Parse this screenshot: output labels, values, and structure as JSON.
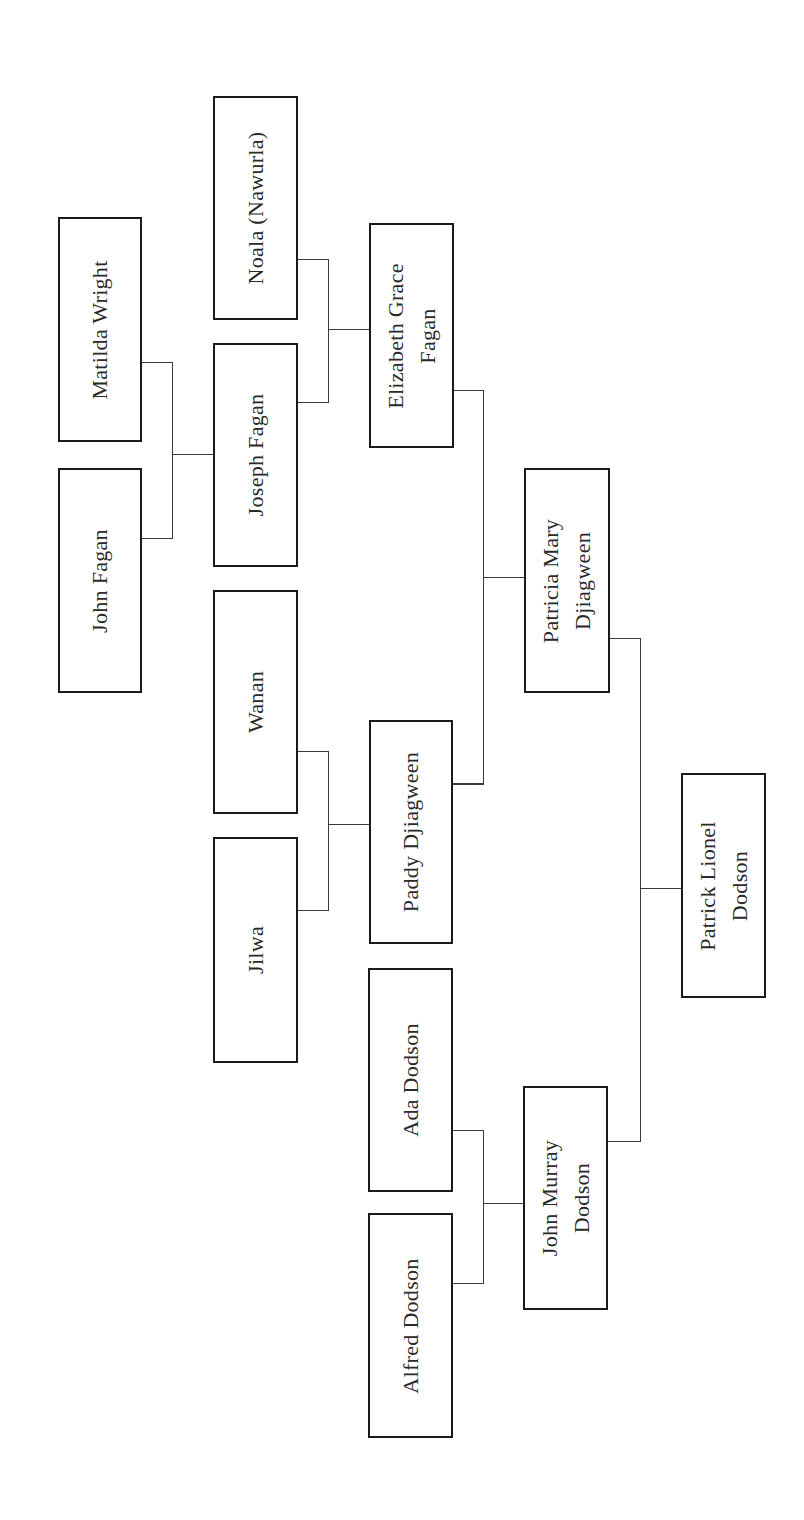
{
  "diagram": {
    "type": "family-tree",
    "orientation": "rotated-90-ccw",
    "colors": {
      "box_border": "#1a1a1a",
      "line": "#3a3a3a",
      "text": "#2a2a2a",
      "background": "#ffffff"
    },
    "people": [
      {
        "id": "matilda_wright",
        "lines": [
          "Matilda Wright"
        ],
        "generation": 4
      },
      {
        "id": "john_fagan",
        "lines": [
          "John Fagan"
        ],
        "generation": 4
      },
      {
        "id": "noala",
        "lines": [
          "Noala (Nawurla)"
        ],
        "generation": 3
      },
      {
        "id": "joseph_fagan",
        "lines": [
          "Joseph Fagan"
        ],
        "generation": 3
      },
      {
        "id": "wanan",
        "lines": [
          "Wanan"
        ],
        "generation": 3
      },
      {
        "id": "jilwa",
        "lines": [
          "Jilwa"
        ],
        "generation": 3
      },
      {
        "id": "elizabeth_grace_fagan",
        "lines": [
          "Elizabeth Grace",
          "Fagan"
        ],
        "generation": 2
      },
      {
        "id": "paddy_djiagween",
        "lines": [
          "Paddy Djiagween"
        ],
        "generation": 2
      },
      {
        "id": "ada_dodson",
        "lines": [
          "Ada Dodson"
        ],
        "generation": 2
      },
      {
        "id": "alfred_dodson",
        "lines": [
          "Alfred Dodson"
        ],
        "generation": 2
      },
      {
        "id": "patricia_mary_djiagween",
        "lines": [
          "Patricia Mary",
          "Djiagween"
        ],
        "generation": 1
      },
      {
        "id": "john_murray_dodson",
        "lines": [
          "John Murray",
          "Dodson"
        ],
        "generation": 1
      },
      {
        "id": "patrick_lionel_dodson",
        "lines": [
          "Patrick Lionel",
          "Dodson"
        ],
        "generation": 0
      }
    ],
    "relationships": [
      {
        "parents": [
          "Matilda Wright",
          "John Fagan"
        ],
        "child": "Joseph Fagan"
      },
      {
        "parents": [
          "Noala (Nawurla)",
          "Joseph Fagan"
        ],
        "child": "Elizabeth Grace Fagan"
      },
      {
        "parents": [
          "Wanan",
          "Jilwa"
        ],
        "child": "Paddy Djiagween"
      },
      {
        "parents": [
          "Ada Dodson",
          "Alfred Dodson"
        ],
        "child": "John Murray Dodson"
      },
      {
        "parents": [
          "Elizabeth Grace Fagan",
          "Paddy Djiagween"
        ],
        "child": "Patricia Mary Djiagween"
      },
      {
        "parents": [
          "Patricia Mary Djiagween",
          "John Murray Dodson"
        ],
        "child": "Patrick Lionel Dodson"
      }
    ]
  }
}
